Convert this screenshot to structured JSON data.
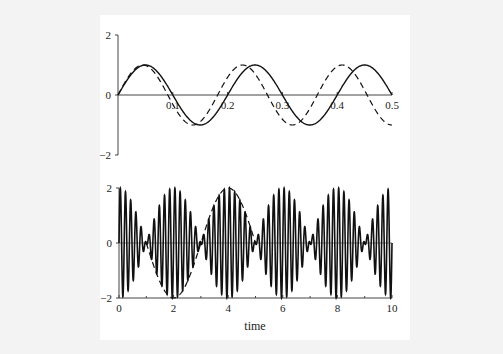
{
  "chart_data": [
    {
      "type": "line",
      "title": "",
      "xlabel": "",
      "ylabel": "",
      "xlim": [
        0,
        0.5
      ],
      "ylim": [
        -2,
        2
      ],
      "xticks": [
        "0.1",
        "0.2",
        "0.3",
        "0.4",
        "0.5"
      ],
      "yticks": [
        "2",
        "0",
        "−2"
      ],
      "grid": false,
      "legend": null,
      "series": [
        {
          "name": "solid",
          "style": "solid",
          "formula": "sin(2*pi*5*t)",
          "frequency": 5,
          "amplitude": 1
        },
        {
          "name": "dashed",
          "style": "dashed",
          "formula": "sin(2*pi*5.5*t)",
          "frequency": 5.5,
          "amplitude": 1
        }
      ]
    },
    {
      "type": "line",
      "title": "",
      "xlabel": "time",
      "ylabel": "",
      "xlim": [
        0,
        10
      ],
      "ylim": [
        -2,
        2
      ],
      "xticks": [
        "0",
        "2",
        "4",
        "6",
        "8",
        "10"
      ],
      "yticks": [
        "2",
        "0",
        "−2"
      ],
      "grid": false,
      "legend": null,
      "series": [
        {
          "name": "sum",
          "style": "solid",
          "formula": "sin(2*pi*5*t) + sin(2*pi*5.5*t)",
          "envelope_peak": 2
        },
        {
          "name": "envelope",
          "style": "dashed",
          "formula": "2*cos(pi*0.5*t)",
          "t_range": [
            1,
            5
          ]
        }
      ]
    }
  ],
  "colors": {
    "line": "#111111",
    "axis": "#333333",
    "background": "#f3f3f3",
    "plot_bg": "#ffffff"
  }
}
